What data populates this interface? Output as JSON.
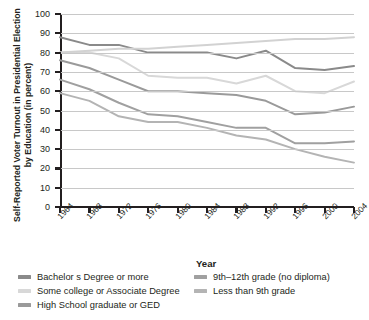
{
  "chart_data": {
    "type": "line",
    "title": "",
    "xlabel": "Year",
    "ylabel": "Self-Reported Voter Turnout in Presidential Election by Education (in percent)",
    "x": [
      1964,
      1968,
      1972,
      1976,
      1980,
      1984,
      1988,
      1992,
      1996,
      2000,
      2004
    ],
    "xtick_labels": [
      "1964",
      "1968",
      "1972",
      "1976",
      "1980",
      "1984",
      "1988",
      "1992",
      "1996",
      "2000",
      "2004"
    ],
    "ylim": [
      0,
      100
    ],
    "ytick_labels": [
      "0",
      "10",
      "20",
      "30",
      "40",
      "50",
      "60",
      "70",
      "80",
      "90",
      "100"
    ],
    "yticks": [
      0,
      10,
      20,
      30,
      40,
      50,
      60,
      70,
      80,
      90,
      100
    ],
    "grid": true,
    "legend_position": "bottom",
    "series": [
      {
        "name": "Bachelor s Degree or more",
        "color": "#8a8a8a",
        "values": [
          88,
          84,
          84,
          80,
          80,
          80,
          77,
          81,
          72,
          71,
          73
        ]
      },
      {
        "name": "Some college or Associate Degree",
        "color": "#d8d8d8",
        "values": [
          80,
          80,
          77,
          68,
          67,
          67,
          64,
          68,
          60,
          59,
          65
        ]
      },
      {
        "name": "High School graduate or GED",
        "color": "#9a9a9a",
        "values": [
          76,
          72,
          66,
          60,
          60,
          59,
          58,
          55,
          48,
          49,
          52
        ]
      },
      {
        "name": "9th–12th grade (no diploma)",
        "color": "#a0a0a0",
        "values": [
          66,
          61,
          54,
          48,
          47,
          44,
          41,
          41,
          33,
          33,
          34
        ]
      },
      {
        "name": "Less than 9th grade",
        "color": "#b4b4b4",
        "values": [
          59,
          55,
          47,
          44,
          44,
          41,
          37,
          35,
          30,
          26,
          23
        ]
      },
      {
        "name": "rising-light-line",
        "color": "#d2d2d2",
        "values": [
          80,
          81,
          82,
          82,
          83,
          84,
          85,
          86,
          87,
          87,
          88
        ]
      }
    ]
  },
  "legend": {
    "column1": [
      {
        "label": "Bachelor s Degree or more",
        "color": "#8a8a8a"
      },
      {
        "label": "Some college or Associate Degree",
        "color": "#d8d8d8"
      },
      {
        "label": "High School graduate or GED",
        "color": "#9a9a9a"
      }
    ],
    "column2": [
      {
        "label": "9th–12th grade (no diploma)",
        "color": "#a0a0a0"
      },
      {
        "label": "Less than 9th grade",
        "color": "#b4b4b4"
      }
    ]
  }
}
